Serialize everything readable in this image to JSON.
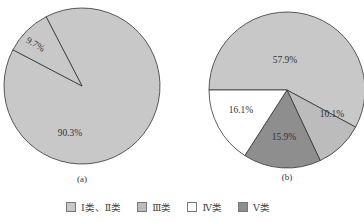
{
  "chart_data": [
    {
      "type": "pie",
      "title": "(a)",
      "categories": [
        "Ⅰ类、Ⅱ类",
        "Ⅲ类"
      ],
      "values": [
        90.3,
        9.7
      ],
      "labels": [
        "90.3%",
        "9.7%"
      ],
      "colors": [
        "#c8c8c8",
        "#c8c8c8"
      ]
    },
    {
      "type": "pie",
      "title": "(b)",
      "categories": [
        "Ⅰ类、Ⅱ类",
        "Ⅲ类",
        "Ⅳ类",
        "Ⅴ类"
      ],
      "values": [
        57.9,
        10.1,
        15.9,
        16.1
      ],
      "labels": [
        "57.9%",
        "10.1%",
        "15.9%",
        "16.1%"
      ],
      "colors": [
        "#c8c8c8",
        "#bcbcbc",
        "#ffffff",
        "#8e8e8e"
      ]
    }
  ],
  "legend": [
    {
      "label": "Ⅰ类、Ⅱ类",
      "color": "#c8c8c8"
    },
    {
      "label": "Ⅲ类",
      "color": "#bcbcbc"
    },
    {
      "label": "Ⅳ类",
      "color": "#ffffff"
    },
    {
      "label": "Ⅴ类",
      "color": "#8e8e8e"
    }
  ],
  "captions": {
    "a": "(a)",
    "b": "(b)"
  }
}
